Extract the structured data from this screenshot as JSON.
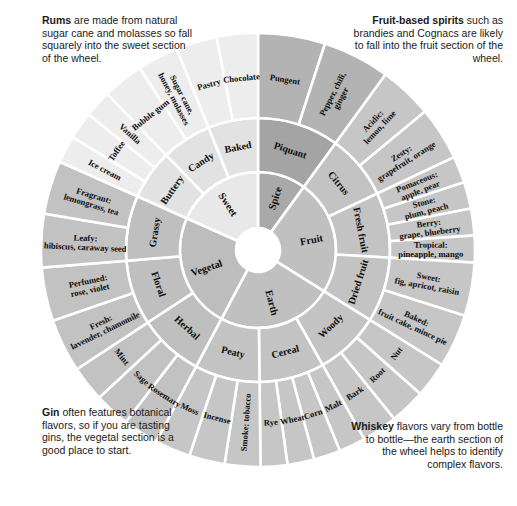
{
  "figure": {
    "geometry": {
      "cx": 258,
      "cy": 250,
      "r_hub": 22,
      "r_ring1": 78,
      "r_ring2": 132,
      "r_ring3": 217,
      "start_angle_deg": -90,
      "divider_color": "#ffffff",
      "divider_width": 2.6
    },
    "palette": {
      "sweet": "#e8e8e8",
      "spice": "#a9a9a9",
      "fruit": "#c0c0c0",
      "earth": "#c0c0c0",
      "vegetal": "#bdbdbd",
      "sweet_mid": "#e2e2e2",
      "sweet_outer": "#ededed",
      "spice_mid": "#a4a4a4",
      "spice_outer": "#b3b3b3",
      "fruit_mid": "#c3c3c3",
      "fruit_outer": "#c6c6c6",
      "earth_mid": "#c3c3c3",
      "earth_outer": "#c6c6c6",
      "vegetal_mid": "#bfbfbf",
      "vegetal_outer": "#c2c2c2",
      "hub": "#ffffff",
      "text": "#0d0d0d"
    },
    "sectors": [
      {
        "name": "Spice",
        "core_label": "Spice",
        "span_deg": 36,
        "fill": "#a9a9a9",
        "fill_mid": "#a4a4a4",
        "fill_outer": "#b3b3b3",
        "ring2": [
          {
            "label": "Piquant",
            "ring3": [
              "Pungent",
              "Pepper, chili, ginger"
            ]
          }
        ]
      },
      {
        "name": "Fruit",
        "core_label": "Fruit",
        "span_deg": 86,
        "fill": "#c0c0c0",
        "fill_mid": "#c3c3c3",
        "fill_outer": "#c6c6c6",
        "ring2": [
          {
            "label": "Citrus",
            "ring3": [
              "Acidic: lemon, lime",
              "Zesty: grapefruit, orange"
            ]
          },
          {
            "label": "Fresh fruit",
            "ring3": [
              "Pomaceous: apple, pear",
              "Stone: plum, peach",
              "Berry: grape, blueberry",
              "Tropical: pineapple, mango"
            ]
          },
          {
            "label": "Dried fruit",
            "ring3": [
              "Sweet: fig, apricot, raisin",
              "Baked: fruit cake, mince pie"
            ]
          }
        ]
      },
      {
        "name": "Earth",
        "core_label": "Earth",
        "span_deg": 86,
        "fill": "#c0c0c0",
        "fill_mid": "#c3c3c3",
        "fill_outer": "#c6c6c6",
        "ring2": [
          {
            "label": "Woody",
            "ring3": [
              "Nut",
              "Root",
              "Bark"
            ]
          },
          {
            "label": "Cereal",
            "ring3": [
              "Malt",
              "Corn",
              "Wheat",
              "Rye"
            ]
          },
          {
            "label": "Peaty",
            "ring3": [
              "Smoke: tobacco",
              "Incense",
              "Moss"
            ]
          }
        ]
      },
      {
        "name": "Vegetal",
        "core_label": "Vegetal",
        "span_deg": 86,
        "fill": "#bdbdbd",
        "fill_mid": "#bfbfbf",
        "fill_outer": "#c2c2c2",
        "ring2": [
          {
            "label": "Herbal",
            "ring3": [
              "Rosemary",
              "Sage",
              "Mint"
            ]
          },
          {
            "label": "Floral",
            "ring3": [
              "Fresh: lavender, chamomile",
              "Perfumed: rose, violet"
            ]
          },
          {
            "label": "Grassy",
            "ring3": [
              "Leafy: hibiscus, caraway seed",
              "Fragrant: lemongrass, tea"
            ]
          }
        ]
      },
      {
        "name": "Sweet",
        "core_label": "Sweet",
        "span_deg": 66,
        "fill": "#e8e8e8",
        "fill_mid": "#e2e2e2",
        "fill_outer": "#ededed",
        "ring2": [
          {
            "label": "Buttery",
            "ring3": [
              "Ice cream",
              "Toffee",
              "Vanilla"
            ]
          },
          {
            "label": "Candy",
            "ring3": [
              "Bubble gum",
              "Sugar cane, honey, molasses"
            ]
          },
          {
            "label": "Baked",
            "ring3": [
              "Pastry",
              "Chocolate"
            ]
          }
        ]
      }
    ]
  },
  "notes": {
    "top_left": {
      "lead": "Rums",
      "body": " are made from natural sugar cane and molasses so fall squarely into the sweet section of the wheel."
    },
    "top_right": {
      "lead": "Fruit-based spirits",
      "body": " such as brandies and Cognacs are likely to fall into the fruit section of the wheel."
    },
    "bottom_left": {
      "lead": "Gin",
      "body": " often features botanical flavors, so if you are tasting gins, the vegetal section is a good place to start."
    },
    "bottom_right": {
      "lead": "Whiskey",
      "body": " flavors vary from bottle to bottle—the earth section of the wheel helps to identify complex flavors."
    }
  }
}
